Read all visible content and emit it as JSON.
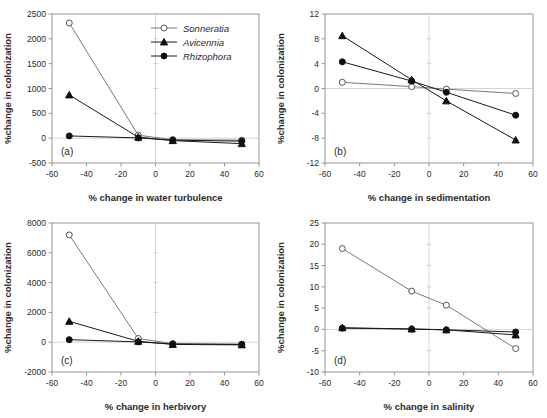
{
  "figure": {
    "panels": [
      "a",
      "b",
      "c",
      "d"
    ],
    "shared_ylabel": "%change in colonization",
    "legend": {
      "position": "top-right of panel a",
      "entries": [
        {
          "label": "Sonneratia",
          "marker": "open-circle",
          "color": "#7a7a7a"
        },
        {
          "label": "Avicennia",
          "marker": "filled-triangle",
          "color": "#1a1a1a"
        },
        {
          "label": "Rhizophora",
          "marker": "filled-circle",
          "color": "#1a1a1a"
        }
      ]
    }
  },
  "chart_data": [
    {
      "type": "line",
      "panel": "a",
      "tag": "(a)",
      "title": "",
      "xlabel": "% change in water turbulence",
      "ylabel": "%change in colonization",
      "x": [
        -50,
        -10,
        10,
        50
      ],
      "xlim": [
        -60,
        60
      ],
      "ylim": [
        -500,
        2500
      ],
      "xticks": [
        -60,
        -40,
        -20,
        0,
        20,
        40,
        60
      ],
      "yticks": [
        -500,
        0,
        500,
        1000,
        1500,
        2000,
        2500
      ],
      "grid": false,
      "series": [
        {
          "name": "Sonneratia",
          "marker": "open-circle",
          "values": [
            2320,
            60,
            -30,
            -40
          ]
        },
        {
          "name": "Avicennia",
          "marker": "filled-triangle",
          "values": [
            870,
            20,
            -50,
            -110
          ]
        },
        {
          "name": "Rhizophora",
          "marker": "filled-circle",
          "values": [
            45,
            5,
            -40,
            -60
          ]
        }
      ]
    },
    {
      "type": "line",
      "panel": "b",
      "tag": "(b)",
      "title": "",
      "xlabel": "% change in sedimentation",
      "ylabel": "%change in colonization",
      "x": [
        -50,
        -10,
        10,
        50
      ],
      "xlim": [
        -60,
        60
      ],
      "ylim": [
        -12,
        12
      ],
      "xticks": [
        -60,
        -40,
        -20,
        0,
        20,
        40,
        60
      ],
      "yticks": [
        -12,
        -8,
        -4,
        0,
        4,
        8,
        12
      ],
      "grid": false,
      "series": [
        {
          "name": "Sonneratia",
          "marker": "open-circle",
          "values": [
            1.0,
            0.3,
            -0.1,
            -0.8
          ]
        },
        {
          "name": "Avicennia",
          "marker": "filled-triangle",
          "values": [
            8.5,
            1.4,
            -2.0,
            -8.3
          ]
        },
        {
          "name": "Rhizophora",
          "marker": "filled-circle",
          "values": [
            4.3,
            1.2,
            -0.6,
            -4.3
          ]
        }
      ]
    },
    {
      "type": "line",
      "panel": "c",
      "tag": "(c)",
      "title": "",
      "xlabel": "% change in herbivory",
      "ylabel": "%change in colonization",
      "x": [
        -50,
        -10,
        10,
        50
      ],
      "xlim": [
        -60,
        60
      ],
      "ylim": [
        -2000,
        8000
      ],
      "xticks": [
        -60,
        -40,
        -20,
        0,
        20,
        40,
        60
      ],
      "yticks": [
        -2000,
        0,
        2000,
        4000,
        6000,
        8000
      ],
      "grid": false,
      "series": [
        {
          "name": "Sonneratia",
          "marker": "open-circle",
          "values": [
            7200,
            250,
            -100,
            -130
          ]
        },
        {
          "name": "Avicennia",
          "marker": "filled-triangle",
          "values": [
            1400,
            60,
            -150,
            -180
          ]
        },
        {
          "name": "Rhizophora",
          "marker": "filled-circle",
          "values": [
            170,
            20,
            -120,
            -150
          ]
        }
      ]
    },
    {
      "type": "line",
      "panel": "d",
      "tag": "(d)",
      "title": "",
      "xlabel": "% change in salinity",
      "ylabel": "%change in colonization",
      "x": [
        -50,
        -10,
        10,
        50
      ],
      "xlim": [
        -60,
        60
      ],
      "ylim": [
        -10,
        25
      ],
      "xticks": [
        -60,
        -40,
        -20,
        0,
        20,
        40,
        60
      ],
      "yticks": [
        -10,
        -5,
        0,
        5,
        10,
        15,
        20,
        25
      ],
      "grid": false,
      "series": [
        {
          "name": "Sonneratia",
          "marker": "open-circle",
          "values": [
            19.0,
            9.0,
            5.7,
            -4.5
          ]
        },
        {
          "name": "Avicennia",
          "marker": "filled-triangle",
          "values": [
            0.4,
            0.1,
            -0.1,
            -1.3
          ]
        },
        {
          "name": "Rhizophora",
          "marker": "filled-circle",
          "values": [
            0.3,
            0.1,
            -0.1,
            -0.6
          ]
        }
      ]
    }
  ]
}
